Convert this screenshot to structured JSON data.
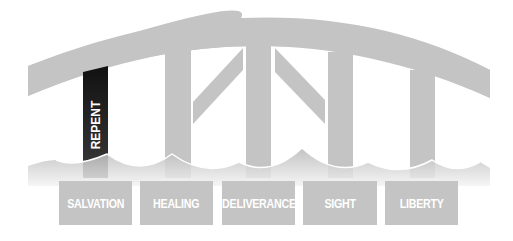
{
  "diagram": {
    "colors": {
      "structure": "#c4c4c4",
      "highlight": "#111111",
      "label_text": "#ffffff",
      "background": "#ffffff"
    },
    "pillar_label": "REPENT",
    "labels": [
      {
        "text": "SALVATION"
      },
      {
        "text": "HEALING"
      },
      {
        "text": "DELIVERANCE"
      },
      {
        "text": "SIGHT"
      },
      {
        "text": "LIBERTY"
      }
    ]
  }
}
